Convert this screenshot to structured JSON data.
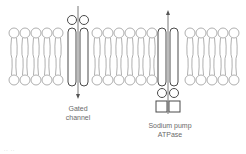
{
  "diagram": {
    "labels": {
      "gated_channel_line1": "Gated",
      "gated_channel_line2": "channel",
      "sodium_pump_line1": "Sodium pump",
      "sodium_pump_line2": "ATPase"
    },
    "corner_mark": "·· ··",
    "colors": {
      "lipid_stroke": "#9a9a9a",
      "protein_stroke": "#4a4a4a",
      "arrow": "#555555",
      "text": "#6a6a6a"
    },
    "membrane": {
      "top_head_y": 33,
      "bottom_head_y": 80,
      "head_radius": 5,
      "lipid_x": [
        14,
        25,
        36,
        47,
        58,
        97,
        108,
        119,
        130,
        141,
        152,
        190,
        201,
        212,
        223,
        234
      ]
    },
    "proteins": [
      {
        "name": "gated-channel",
        "left_x": 68,
        "right_x": 86,
        "arrow_direction": "down",
        "extra_heads": "top"
      },
      {
        "name": "sodium-pump",
        "left_x": 157,
        "right_x": 177,
        "arrow_direction": "up",
        "extra_heads": "bottom",
        "boxes": 2
      }
    ]
  }
}
